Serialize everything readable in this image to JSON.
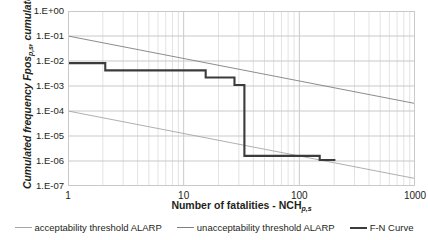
{
  "chart_data": {
    "type": "line",
    "title": "",
    "xlabel": "Number of fatalities - NCH",
    "xlabel_sub": "p,s",
    "ylabel": "Cumulated frequency Fpos",
    "ylabel_sub": "p,s",
    "ylabel_tail": "cumulated",
    "xscale": "log",
    "yscale": "log",
    "xlim": [
      1,
      1000
    ],
    "ylim": [
      1e-07,
      1
    ],
    "grid": true,
    "minor_grid": true,
    "legend_position": "bottom",
    "xticklabels": [
      "1",
      "10",
      "100",
      "1000"
    ],
    "xtickvalues": [
      1,
      10,
      100,
      1000
    ],
    "yticklabels": [
      "1.E+00",
      "1.E-01",
      "1.E-02",
      "1.E-03",
      "1.E-04",
      "1.E-05",
      "1.E-06",
      "1.E-07"
    ],
    "ytickvalues": [
      1,
      0.1,
      0.01,
      0.001,
      0.0001,
      1e-05,
      1e-06,
      1e-07
    ],
    "series": [
      {
        "name": "acceptability threshold ALARP",
        "style": "line",
        "color": "#a6a6a6",
        "width": 0.9,
        "x": [
          1,
          1000
        ],
        "y": [
          0.0001,
          2e-07
        ]
      },
      {
        "name": "unacceptability threshold ALARP",
        "style": "line",
        "color": "#7f7f7f",
        "width": 0.9,
        "x": [
          1,
          1000
        ],
        "y": [
          0.1,
          0.0002
        ]
      },
      {
        "name": "F-N Curve",
        "style": "step",
        "color": "#3b3b3b",
        "width": 2.1,
        "x": [
          1,
          2.1,
          2.1,
          8.3,
          8.3,
          15.5,
          15.5,
          27.5,
          27.5,
          33.5,
          33.5,
          150,
          150,
          205
        ],
        "y": [
          0.0082,
          0.0082,
          0.0042,
          0.0042,
          0.0042,
          0.0042,
          0.0022,
          0.0022,
          0.0011,
          0.0011,
          1.6e-06,
          1.6e-06,
          1.1e-06,
          1.1e-06
        ]
      }
    ]
  },
  "legend": {
    "items": [
      {
        "label": "acceptability threshold ALARP",
        "swatch": "thin"
      },
      {
        "label": "unacceptability threshold ALARP",
        "swatch": "mid"
      },
      {
        "label": "F-N Curve",
        "swatch": "thick"
      }
    ]
  }
}
